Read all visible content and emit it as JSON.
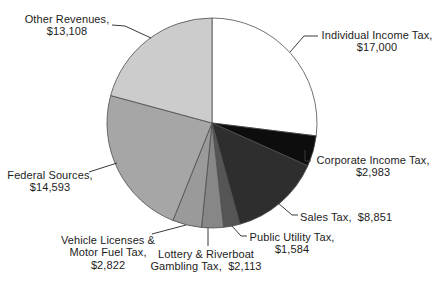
{
  "background": "#ffffff",
  "chart_data": {
    "type": "pie",
    "title": "",
    "legend": "none",
    "direction": "clockwise",
    "start_angle_deg": 0,
    "labels_position": "outside-with-leader-lines",
    "stroke_color": "#4d4d4d",
    "total": 63054,
    "slices": [
      {
        "label": "Individual Income Tax",
        "value": 17000,
        "display_value": "$17,000",
        "color": "#ffffff",
        "label_lines": [
          "Individual Income Tax,",
          "$17,000"
        ]
      },
      {
        "label": "Corporate Income Tax",
        "value": 2983,
        "display_value": "$2,983",
        "color": "#0d0d0d",
        "label_lines": [
          "Corporate Income Tax,",
          "$2,983"
        ]
      },
      {
        "label": "Sales Tax",
        "value": 8851,
        "display_value": "$8,851",
        "color": "#2e2e2e",
        "label_lines": [
          "Sales Tax,  $8,851"
        ]
      },
      {
        "label": "Public Utility Tax",
        "value": 1584,
        "display_value": "$1,584",
        "color": "#555555",
        "label_lines": [
          "Public Utility Tax,",
          "$1,584"
        ]
      },
      {
        "label": "Lottery & Riverboat Gambling Tax",
        "value": 2113,
        "display_value": "$2,113",
        "color": "#878787",
        "label_lines": [
          "Lottery & Riverboat",
          "Gambling Tax,  $2,113"
        ]
      },
      {
        "label": "Vehicle Licenses & Motor Fuel Tax",
        "value": 2822,
        "display_value": "$2,822",
        "color": "#9a9a9a",
        "label_lines": [
          "Vehicle Licenses &",
          "Motor Fuel Tax,",
          "$2,822"
        ]
      },
      {
        "label": "Federal Sources",
        "value": 14593,
        "display_value": "$14,593",
        "color": "#a6a6a6",
        "label_lines": [
          "Federal Sources,",
          "$14,593"
        ]
      },
      {
        "label": "Other Revenues",
        "value": 13108,
        "display_value": "$13,108",
        "color": "#cccccc",
        "label_lines": [
          "Other Revenues,",
          "$13,108"
        ]
      }
    ]
  }
}
